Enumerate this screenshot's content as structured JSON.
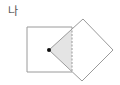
{
  "label": "나",
  "figure": {
    "square": {
      "x": 27,
      "y": 27,
      "size": 45
    },
    "diamond": {
      "points": "49,50 83,19 113,50 82,81"
    },
    "overlap": {
      "points": "49,50 72,29 72,71"
    },
    "center_dot": {
      "x": 49,
      "y": 50
    },
    "colors": {
      "stroke": "#9a9a9a",
      "fill_overlap": "#e4e4e4",
      "dot": "#111111"
    }
  }
}
